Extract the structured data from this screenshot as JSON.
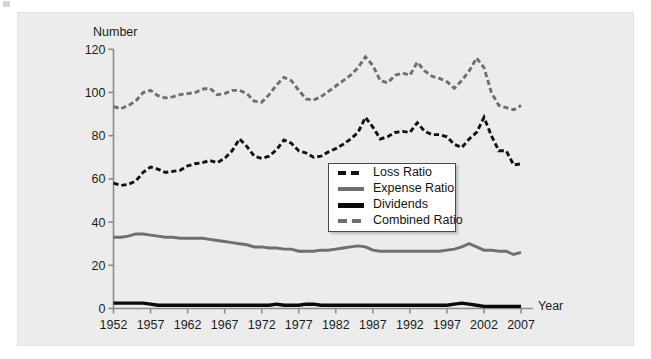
{
  "figure": {
    "background": "#ffffff",
    "panel_background": "#ececed",
    "panel_border": "#e3e3e4"
  },
  "axes": {
    "y_axis_title": "Number",
    "x_axis_title": "Year",
    "y_ticks": [
      "0",
      "20",
      "40",
      "60",
      "80",
      "100",
      "120"
    ],
    "x_ticks": [
      "1952",
      "1957",
      "1962",
      "1967",
      "1972",
      "1977",
      "1982",
      "1987",
      "1992",
      "1997",
      "2002",
      "2007"
    ]
  },
  "legend": {
    "items": [
      {
        "label": "Loss Ratio",
        "color": "#111111",
        "style": "dashed",
        "icon": "dashed-line-icon"
      },
      {
        "label": "Expense Ratio",
        "color": "#6f6f6f",
        "style": "solid",
        "icon": "solid-line-icon"
      },
      {
        "label": "Dividends",
        "color": "#0a0a0a",
        "style": "solid",
        "icon": "solid-line-icon"
      },
      {
        "label": "Combined Ratio",
        "color": "#6f6f6f",
        "style": "dashed",
        "icon": "dashed-line-icon"
      }
    ]
  },
  "chart_data": {
    "type": "line",
    "title": "",
    "xlabel": "Year",
    "ylabel": "Number",
    "ylim": [
      0,
      120
    ],
    "xlim": [
      1952,
      2008
    ],
    "grid": false,
    "legend_position": "center",
    "x": [
      1952,
      1953,
      1954,
      1955,
      1956,
      1957,
      1958,
      1959,
      1960,
      1961,
      1962,
      1963,
      1964,
      1965,
      1966,
      1967,
      1968,
      1969,
      1970,
      1971,
      1972,
      1973,
      1974,
      1975,
      1976,
      1977,
      1978,
      1979,
      1980,
      1981,
      1982,
      1983,
      1984,
      1985,
      1986,
      1987,
      1988,
      1989,
      1990,
      1991,
      1992,
      1993,
      1994,
      1995,
      1996,
      1997,
      1998,
      1999,
      2000,
      2001,
      2002,
      2003,
      2004,
      2005,
      2006,
      2007
    ],
    "series": [
      {
        "name": "Loss Ratio",
        "color": "#111111",
        "style": "dashed",
        "values": [
          58,
          57,
          57.5,
          59,
          63,
          65.5,
          64.5,
          63,
          63.5,
          64,
          66,
          67,
          67.5,
          68.5,
          67.5,
          69.5,
          73,
          78.5,
          75,
          70.5,
          69.5,
          70.5,
          73.5,
          78,
          76.5,
          73,
          72,
          70,
          70.5,
          72.5,
          74,
          76,
          78.5,
          81.5,
          88.5,
          84,
          78.5,
          79.5,
          81.5,
          82,
          81.5,
          86,
          82,
          80.5,
          80.5,
          79.5,
          76,
          74.5,
          78.5,
          81.5,
          88.5,
          80,
          73,
          73,
          66.5,
          67
        ]
      },
      {
        "name": "Expense Ratio",
        "color": "#6f6f6f",
        "style": "solid",
        "values": [
          33,
          33,
          33.5,
          34.5,
          34.5,
          34,
          33.5,
          33,
          33,
          32.5,
          32.5,
          32.5,
          32.5,
          32,
          31.5,
          31,
          30.5,
          30,
          29.5,
          28.5,
          28.5,
          28,
          28,
          27.5,
          27.5,
          26.5,
          26.5,
          26.5,
          27,
          27,
          27.5,
          28,
          28.5,
          29,
          28.5,
          27,
          26.5,
          26.5,
          26.5,
          26.5,
          26.5,
          26.5,
          26.5,
          26.5,
          26.5,
          27,
          27.5,
          28.5,
          30,
          28.5,
          27,
          27,
          26.5,
          26.5,
          25,
          26
        ]
      },
      {
        "name": "Dividends",
        "color": "#0a0a0a",
        "style": "solid",
        "values": [
          2.5,
          2.5,
          2.5,
          2.5,
          2.5,
          2,
          1.5,
          1.5,
          1.5,
          1.5,
          1.5,
          1.5,
          1.5,
          1.5,
          1.5,
          1.5,
          1.5,
          1.5,
          1.5,
          1.5,
          1.5,
          1.5,
          2,
          1.5,
          1.5,
          1.5,
          2,
          2,
          1.5,
          1.5,
          1.5,
          1.5,
          1.5,
          1.5,
          1.5,
          1.5,
          1.5,
          1.5,
          1.5,
          1.5,
          1.5,
          1.5,
          1.5,
          1.5,
          1.5,
          1.5,
          2,
          2.5,
          2,
          1.5,
          1,
          1,
          1,
          1,
          1,
          1
        ]
      },
      {
        "name": "Combined Ratio",
        "color": "#6f6f6f",
        "style": "dashed",
        "values": [
          93.5,
          92.5,
          94,
          96,
          100,
          101,
          98.5,
          97.5,
          98,
          99,
          99.5,
          100,
          101.5,
          102,
          99,
          99.5,
          101,
          101,
          99.5,
          96,
          95.5,
          99,
          103.5,
          107,
          105.5,
          101,
          97,
          96.5,
          98,
          100.5,
          103,
          105.5,
          108,
          111.5,
          116.5,
          112.5,
          105.5,
          104.5,
          108,
          109,
          108,
          114,
          110,
          107.5,
          106.5,
          105,
          102,
          105.5,
          110,
          116,
          111.5,
          100,
          94,
          93,
          92,
          94
        ]
      }
    ]
  }
}
